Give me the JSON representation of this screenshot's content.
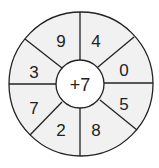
{
  "wheel": {
    "center_label": "+7",
    "segments": [
      {
        "position": "top-left",
        "value": "9"
      },
      {
        "position": "top-right",
        "value": "4"
      },
      {
        "position": "right-upper",
        "value": "0"
      },
      {
        "position": "right-lower",
        "value": "5"
      },
      {
        "position": "bottom-right",
        "value": "8"
      },
      {
        "position": "bottom-left",
        "value": "2"
      },
      {
        "position": "left-lower",
        "value": "7"
      },
      {
        "position": "left-upper",
        "value": "3"
      }
    ],
    "colors": {
      "segment_fill": "#f1f1f1",
      "center_fill": "#ffffff",
      "stroke": "#222222"
    }
  }
}
